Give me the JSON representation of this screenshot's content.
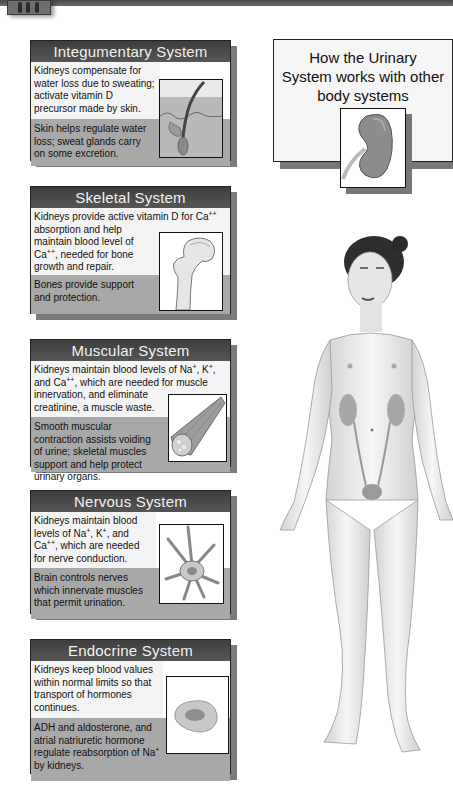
{
  "title_box": {
    "title": "How the Urinary System works with other body systems",
    "title_lines": [
      "How the Urinary",
      "System works with other",
      "body systems"
    ],
    "icon": "kidney-icon"
  },
  "cards": [
    {
      "heading": "Integumentary System",
      "kidney_effect": "Kidneys compensate for water loss due to sweating; activate vitamin D precursor made by skin.",
      "system_effect": "Skin helps regulate water loss; sweat glands carry on some excretion.",
      "icon": "skin-hair-follicle-icon"
    },
    {
      "heading": "Skeletal System",
      "kidney_effect_parts": [
        "Kidneys provide active vitamin D for Ca",
        "++",
        " absorption and help maintain blood level of Ca",
        "++",
        ", needed for bone growth and repair."
      ],
      "system_effect": "Bones provide support and protection.",
      "icon": "femur-bone-icon"
    },
    {
      "heading": "Muscular System",
      "kidney_effect_parts": [
        "Kidneys maintain blood levels of Na",
        "+",
        ", K",
        "+",
        ", and Ca",
        "++",
        ", which are needed for muscle innervation, and eliminate creatinine, a muscle waste."
      ],
      "system_effect": "Smooth muscular contraction assists voiding of urine; skeletal muscles support and help protect urinary organs.",
      "icon": "muscle-fiber-icon"
    },
    {
      "heading": "Nervous System",
      "kidney_effect_parts": [
        "Kidneys maintain blood levels of Na",
        "+",
        ", K",
        "+",
        ", and Ca",
        "++",
        ", which are needed for nerve conduction."
      ],
      "system_effect": "Brain controls nerves which innervate muscles that permit urination.",
      "icon": "neuron-icon"
    },
    {
      "heading": "Endocrine System",
      "kidney_effect": "Kidneys keep blood values within normal limits so that transport of hormones continues.",
      "system_effect_parts": [
        "ADH and aldosterone, and atrial natriuretic hormone regulate reabsorption of Na",
        "+",
        " by kidneys."
      ],
      "icon": "endocrine-gland-icon"
    }
  ],
  "figure": {
    "icon": "human-female-urinary-anatomy-illustration"
  }
}
